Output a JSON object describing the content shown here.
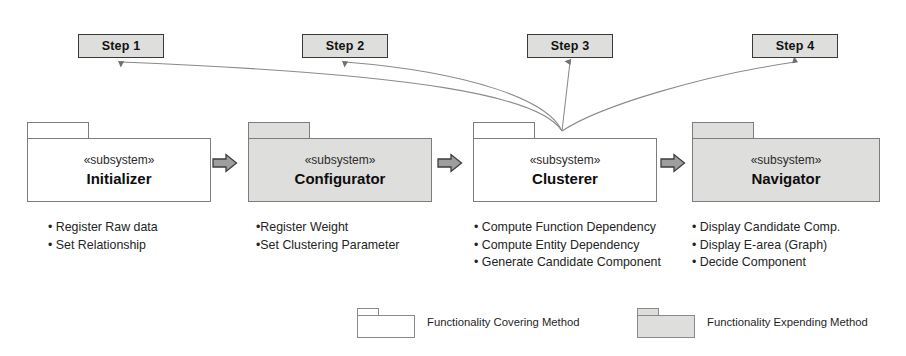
{
  "diagram": {
    "colors": {
      "fill_gray": "#dededd",
      "fill_white": "#ffffff",
      "stroke": "#7d7d7d",
      "step_stroke": "#3a3a3a",
      "arrow_fill": "#9e9e9e",
      "background": "#ffffff"
    }
  },
  "steps": [
    {
      "label": "Step 1",
      "x": 78,
      "y": 34,
      "w": 86
    },
    {
      "label": "Step 2",
      "x": 302,
      "y": 34,
      "w": 86
    },
    {
      "label": "Step 3",
      "x": 527,
      "y": 34,
      "w": 86
    },
    {
      "label": "Step 4",
      "x": 752,
      "y": 34,
      "w": 86
    }
  ],
  "packages": [
    {
      "stereotype": "«subsystem»",
      "name": "Initializer",
      "fill": "white",
      "x": 27,
      "y": 122,
      "w": 184,
      "bullets": [
        "• Register Raw data",
        "• Set Relationship"
      ],
      "bullets_x": 48,
      "bullets_y": 219
    },
    {
      "stereotype": "«subsystem»",
      "name": "Configurator",
      "fill": "gray",
      "x": 248,
      "y": 122,
      "w": 184,
      "bullets": [
        "•Register Weight",
        "•Set Clustering Parameter"
      ],
      "bullets_x": 256,
      "bullets_y": 219
    },
    {
      "stereotype": "«subsystem»",
      "name": "Clusterer",
      "fill": "white",
      "x": 473,
      "y": 122,
      "w": 184,
      "bullets": [
        "• Compute Function Dependency",
        "• Compute Entity Dependency",
        "• Generate Candidate Component"
      ],
      "bullets_x": 474,
      "bullets_y": 219
    },
    {
      "stereotype": "«subsystem»",
      "name": "Navigator",
      "fill": "gray",
      "x": 692,
      "y": 122,
      "w": 188,
      "bullets": [
        "• Display Candidate Comp.",
        "• Display E-area (Graph)",
        "• Decide Component"
      ],
      "bullets_x": 692,
      "bullets_y": 219
    }
  ],
  "flow_arrows": [
    {
      "name": "initializer-to-configurator",
      "x": 212,
      "y": 163
    },
    {
      "name": "configurator-to-clusterer",
      "x": 437,
      "y": 163
    },
    {
      "name": "clusterer-to-navigator",
      "x": 660,
      "y": 163
    }
  ],
  "legend": {
    "items": [
      {
        "label": "Functionality Covering Method",
        "fill": "white",
        "x": 357,
        "y": 308
      },
      {
        "label": "Functionality Expending Method",
        "fill": "gray",
        "x": 637,
        "y": 308
      }
    ]
  },
  "connectors": {
    "origin_x": 562,
    "origin_y": 131,
    "targets": [
      121,
      345,
      570,
      795
    ],
    "target_y": 59
  }
}
